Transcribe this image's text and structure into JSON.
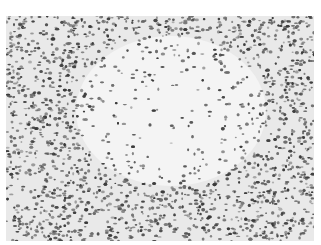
{
  "image": {
    "description": "Grayscale histology micrograph of lymphoid tissue with a pale central zone surrounded by densely packed dark-staining cells",
    "colors": {
      "background": "#ffffff",
      "tissue": "#e9e9e9",
      "pale_center": "#f4f4f4",
      "cell_dark": "#3a3a3a",
      "cell_mid": "#6e6e6e"
    },
    "pale_center": {
      "cx": 165,
      "cy": 95,
      "rx": 95,
      "ry": 75
    }
  }
}
